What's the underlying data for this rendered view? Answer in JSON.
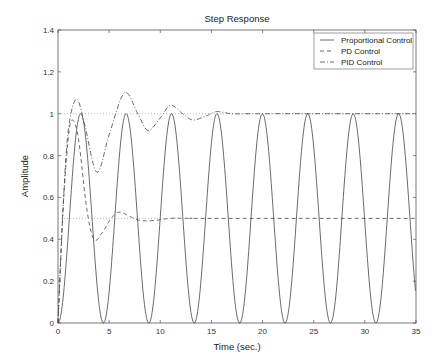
{
  "chart_data": {
    "type": "line",
    "title": "Step Response",
    "xlabel": "Time (sec.)",
    "ylabel": "Amplitude",
    "xlim": [
      0,
      35
    ],
    "ylim": [
      0,
      1.4
    ],
    "xticks": [
      0,
      5,
      10,
      15,
      20,
      25,
      30,
      35
    ],
    "yticks": [
      0,
      0.2,
      0.4,
      0.6,
      0.8,
      1,
      1.2,
      1.4
    ],
    "ytick_labels": [
      "0",
      "0.2",
      "0.4",
      "0.6",
      "0.8",
      "1",
      "1.2",
      "1.4"
    ],
    "grid": false,
    "legend_position": "upper right",
    "reference_lines": [
      {
        "y": 1.0,
        "style": "dotted",
        "x_range": [
          0,
          35
        ]
      },
      {
        "y": 0.5,
        "style": "dotted",
        "x_range": [
          0,
          12
        ]
      }
    ],
    "series": [
      {
        "name": "Proportional Control",
        "style": "solid",
        "x": [
          0,
          1.11,
          2.22,
          3.33,
          4.44,
          5.55,
          6.66,
          7.77,
          8.89,
          10.0,
          11.1,
          12.2,
          13.3,
          14.4,
          15.5,
          16.7,
          17.8,
          18.9,
          20.0,
          21.1,
          22.2,
          23.3,
          24.4,
          25.5,
          26.7,
          27.8,
          28.9,
          30.0,
          31.1,
          32.2,
          33.3,
          34.4,
          35
        ],
        "values": [
          0,
          0.5,
          1.0,
          0.5,
          0,
          0.5,
          1.0,
          0.5,
          0,
          0.5,
          1.0,
          0.5,
          0,
          0.5,
          1.0,
          0.5,
          0,
          0.5,
          1.0,
          0.5,
          0,
          0.5,
          1.0,
          0.5,
          0,
          0.5,
          1.0,
          0.5,
          0,
          0.5,
          1.0,
          0.5,
          0.25
        ]
      },
      {
        "name": "PD Control",
        "style": "dashed",
        "x": [
          0,
          0.5,
          1.0,
          1.4,
          2.0,
          2.8,
          3.5,
          4.3,
          5.2,
          6.0,
          7.0,
          8.0,
          9.5,
          11,
          13,
          15,
          35
        ],
        "values": [
          0,
          0.55,
          0.88,
          0.97,
          0.88,
          0.55,
          0.4,
          0.43,
          0.5,
          0.53,
          0.51,
          0.49,
          0.49,
          0.5,
          0.5,
          0.5,
          0.5
        ]
      },
      {
        "name": "PID Control",
        "style": "dash-dot",
        "x": [
          0,
          0.5,
          1.0,
          1.8,
          2.6,
          3.8,
          5.0,
          6.5,
          7.8,
          8.8,
          10.0,
          11.0,
          12.2,
          13.2,
          14.5,
          15.5,
          17,
          19,
          21,
          25,
          35
        ],
        "values": [
          0,
          0.55,
          0.92,
          1.07,
          0.95,
          0.72,
          0.9,
          1.1,
          1.0,
          0.92,
          0.98,
          1.04,
          1.0,
          0.97,
          0.99,
          1.01,
          1.0,
          1.0,
          1.0,
          1.0,
          1.0
        ]
      }
    ]
  },
  "legend": {
    "items": [
      {
        "label": "Proportional Control"
      },
      {
        "label": "PD Control"
      },
      {
        "label": "PID Control"
      }
    ]
  }
}
